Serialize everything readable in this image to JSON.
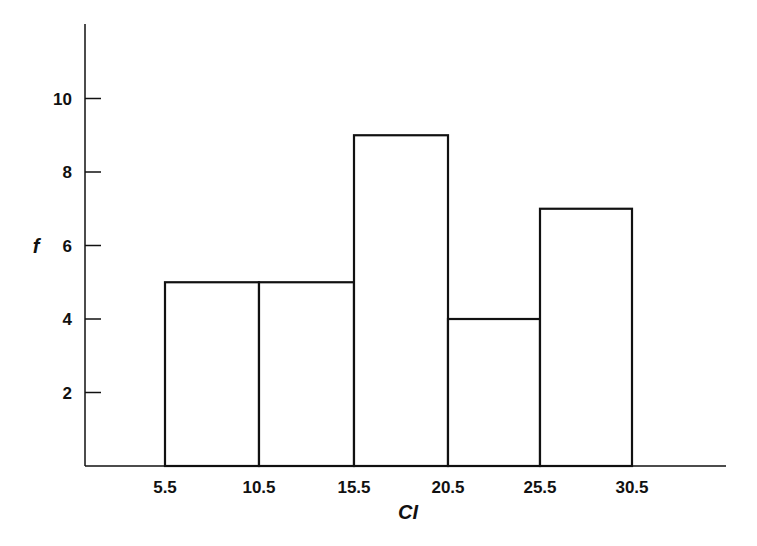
{
  "chart_data": {
    "type": "bar",
    "subtype": "histogram",
    "title": "",
    "xlabel": "CI",
    "ylabel": "f",
    "bin_edges": [
      5.5,
      10.5,
      15.5,
      20.5,
      25.5,
      30.5
    ],
    "categories": [
      "5.5-10.5",
      "10.5-15.5",
      "15.5-20.5",
      "20.5-25.5",
      "25.5-30.5"
    ],
    "values": [
      5,
      5,
      9,
      4,
      7
    ],
    "x_tick_labels": [
      "5.5",
      "10.5",
      "15.5",
      "20.5",
      "25.5",
      "30.5"
    ],
    "y_ticks": [
      2,
      4,
      6,
      8,
      10
    ],
    "y_tick_labels": [
      "2",
      "4",
      "6",
      "8",
      "10"
    ],
    "ylim": [
      0,
      12
    ],
    "grid": false,
    "legend": null,
    "bar_fill": "#ffffff",
    "bar_stroke": "#111111",
    "axis_color": "#111111"
  }
}
